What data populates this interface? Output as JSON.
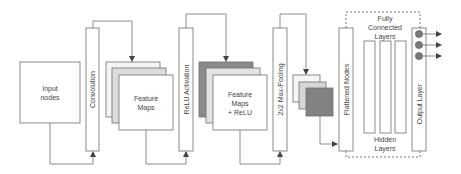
{
  "diagram": {
    "colors": {
      "stroke": "#6e6e6e",
      "text": "#444444",
      "map_light": "#f4f4f4",
      "map_mid": "#dcdcdc",
      "map_dark": "#8a8a8a",
      "node_fill": "#7a7a7a",
      "box_fill": "#ffffff"
    },
    "nodes": {
      "input": {
        "label_lines": [
          "Input",
          "nodes"
        ]
      },
      "convolution": {
        "label": "Convolution"
      },
      "feature_maps": {
        "label_lines": [
          "Feature",
          "Maps"
        ]
      },
      "relu": {
        "label": "ReLU Activation"
      },
      "feature_maps_relu": {
        "label_lines": [
          "Feature",
          "Maps",
          "+ ReLU"
        ]
      },
      "max_pooling": {
        "label": "2x2 Max-Pooling"
      },
      "flattened": {
        "label": "Flattened Nodes"
      },
      "fully_connected": {
        "label_lines": [
          "Fully",
          "Connected",
          "Layers"
        ]
      },
      "hidden_layers": {
        "label_lines": [
          "Hidden",
          "Layers"
        ],
        "count": 3
      },
      "output_layer": {
        "label": "Output Layer",
        "node_count": 3
      }
    }
  }
}
